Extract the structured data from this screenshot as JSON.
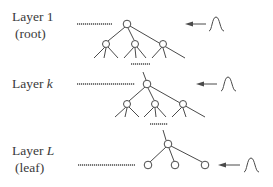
{
  "layers": [
    {
      "id": "layer-1",
      "title_prefix": "Layer ",
      "title_var": "1",
      "var_italic": false,
      "subtitle": "(root)"
    },
    {
      "id": "layer-k",
      "title_prefix": "Layer ",
      "title_var": "k",
      "var_italic": true,
      "subtitle": ""
    },
    {
      "id": "layer-L",
      "title_prefix": "Layer ",
      "title_var": "L",
      "var_italic": true,
      "subtitle": "(leaf)"
    }
  ],
  "colors": {
    "stroke": "#4a4a4a",
    "text": "#3a3a3a",
    "background": "#ffffff"
  },
  "icons": {
    "arrow": "arrow-left-icon",
    "input": "gaussian-bell-icon"
  }
}
